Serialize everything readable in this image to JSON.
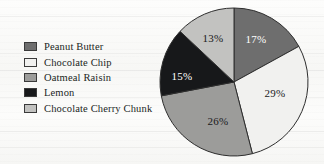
{
  "chart_data": {
    "type": "pie",
    "title": "",
    "subtitle": "",
    "legend_position": "left",
    "grid": false,
    "categories": [
      "Peanut Butter",
      "Chocolate Chip",
      "Oatmeal Raisin",
      "Lemon",
      "Chocolate Cherry Chunk"
    ],
    "values": [
      17,
      29,
      26,
      15,
      13
    ],
    "value_unit": "%",
    "data_labels": [
      "17%",
      "29%",
      "26%",
      "15%",
      "13%"
    ],
    "slice_colors": [
      "#6e6e6e",
      "#f1f1ef",
      "#9c9c9a",
      "#17181a",
      "#c2c2c0"
    ],
    "label_text_colors": [
      "#ffffff",
      "#1a1a1a",
      "#1a1a1a",
      "#ffffff",
      "#1a1a1a"
    ],
    "start_angle_deg": 0,
    "direction": "clockwise"
  },
  "legend": {
    "items": [
      {
        "label": "Peanut Butter",
        "color": "#6e6e6e",
        "value_label": "17%"
      },
      {
        "label": "Chocolate Chip",
        "color": "#f1f1ef",
        "value_label": "29%"
      },
      {
        "label": "Oatmeal Raisin",
        "color": "#9c9c9a",
        "value_label": "26%"
      },
      {
        "label": "Lemon",
        "color": "#17181a",
        "value_label": "15%"
      },
      {
        "label": "Chocolate Cherry Chunk",
        "color": "#c2c2c0",
        "value_label": "13%"
      }
    ]
  },
  "pie": {
    "center_x": 78,
    "center_y": 78,
    "radius": 74,
    "outline_color": "#2e2e2e",
    "slices": [
      {
        "name": "Peanut Butter",
        "percent": 17,
        "label": "17%",
        "fill": "#6e6e6e",
        "text_color": "#ffffff",
        "label_x": 100,
        "label_y": 36
      },
      {
        "name": "Chocolate Chip",
        "percent": 29,
        "label": "29%",
        "fill": "#f1f1ef",
        "text_color": "#1a1a1a",
        "label_x": 119,
        "label_y": 90
      },
      {
        "name": "Oatmeal Raisin",
        "percent": 26,
        "label": "26%",
        "fill": "#9c9c9a",
        "text_color": "#1a1a1a",
        "label_x": 62,
        "label_y": 118
      },
      {
        "name": "Lemon",
        "percent": 15,
        "label": "15%",
        "fill": "#17181a",
        "text_color": "#ffffff",
        "label_x": 26,
        "label_y": 73
      },
      {
        "name": "Chocolate Cherry Chunk",
        "percent": 13,
        "label": "13%",
        "fill": "#c2c2c0",
        "text_color": "#1a1a1a",
        "label_x": 57,
        "label_y": 35
      }
    ]
  }
}
